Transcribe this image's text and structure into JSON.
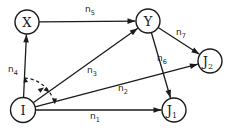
{
  "figure": {
    "background": "#ffffff",
    "ink": "#1b1b1b",
    "nodes": [
      {
        "id": "X",
        "label": "X",
        "sub": "",
        "x": 27,
        "y": 22,
        "r": 12
      },
      {
        "id": "Y",
        "label": "Y",
        "sub": "",
        "x": 148,
        "y": 21,
        "r": 12
      },
      {
        "id": "J2",
        "label": "J",
        "sub": "2",
        "x": 210,
        "y": 61,
        "r": 12
      },
      {
        "id": "I",
        "label": "I",
        "sub": "",
        "x": 23,
        "y": 110,
        "r": 12.5
      },
      {
        "id": "J1",
        "label": "J",
        "sub": "1",
        "x": 174,
        "y": 110,
        "r": 12
      }
    ],
    "edges": [
      {
        "id": "n5",
        "from": "X",
        "to": "Y",
        "label": "n",
        "sub": "5",
        "lx": 90,
        "ly": 9
      },
      {
        "id": "n4",
        "from": "I",
        "to": "X",
        "label": "n",
        "sub": "4",
        "lx": 13,
        "ly": 69
      },
      {
        "id": "n3",
        "from": "I",
        "to": "Y",
        "label": "n",
        "sub": "3",
        "lx": 92,
        "ly": 70
      },
      {
        "id": "n2",
        "from": "I",
        "to": "J2",
        "label": "n",
        "sub": "2",
        "lx": 123,
        "ly": 88
      },
      {
        "id": "n1",
        "from": "I",
        "to": "J1",
        "label": "n",
        "sub": "1",
        "lx": 95,
        "ly": 116
      },
      {
        "id": "n7",
        "from": "Y",
        "to": "J2",
        "label": "n",
        "sub": "7",
        "lx": 181,
        "ly": 32
      },
      {
        "id": "n6",
        "from": "Y",
        "to": "J1",
        "label": "n",
        "sub": "6",
        "lx": 162,
        "ly": 58
      }
    ],
    "sweep_annotation": {
      "style": "dashed-arc",
      "arc": {
        "cx": 23,
        "cy": 110,
        "r": 32,
        "start_deg": -87,
        "end_deg": -12
      },
      "dash": "3.2 2.8",
      "arrowheads": [
        {
          "x": 24.5,
          "y": 76.5,
          "deg": -102
        },
        {
          "x": 44,
          "y": 87.5,
          "deg": -35
        },
        {
          "x": 49.5,
          "y": 92.5,
          "deg": 42
        },
        {
          "x": 54.8,
          "y": 104.5,
          "deg": 90
        }
      ]
    }
  }
}
